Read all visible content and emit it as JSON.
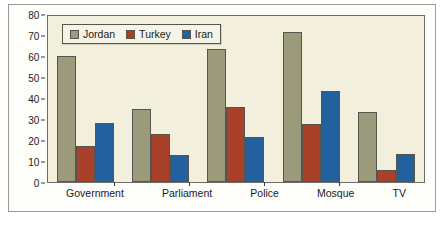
{
  "chart_data": {
    "type": "bar",
    "title": "",
    "subtitle": "",
    "xlabel": "",
    "ylabel": "",
    "ylim": [
      0,
      80
    ],
    "yticks": [
      0,
      10,
      20,
      30,
      40,
      50,
      60,
      70,
      80
    ],
    "grid": false,
    "legend_position": "top-left-inside",
    "categories": [
      "Government",
      "Parliament",
      "Police",
      "Mosque",
      "TV"
    ],
    "series": [
      {
        "name": "Jordan",
        "color": "#9b9b7b",
        "values": [
          60,
          35,
          63.5,
          71.5,
          33.5
        ]
      },
      {
        "name": "Turkey",
        "color": "#a8402a",
        "values": [
          17,
          23,
          35.5,
          27.5,
          5.5
        ]
      },
      {
        "name": "Iran",
        "color": "#22609e",
        "values": [
          28,
          13,
          21.5,
          43.5,
          13.5
        ]
      }
    ]
  },
  "legend": {
    "items": [
      {
        "label": "Jordan",
        "swatch": "jordan"
      },
      {
        "label": "Turkey",
        "swatch": "turkey"
      },
      {
        "label": "Iran",
        "swatch": "iran"
      }
    ]
  }
}
